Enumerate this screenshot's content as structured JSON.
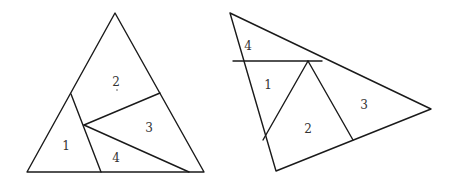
{
  "figures": [
    {
      "name": "left-triangle",
      "outline": [
        [
          115,
          13
        ],
        [
          27,
          172
        ],
        [
          204,
          172
        ]
      ],
      "cuts": [
        [
          [
            71,
            94
          ],
          [
            101,
            172
          ]
        ],
        [
          [
            84,
            125
          ],
          [
            160,
            93
          ]
        ],
        [
          [
            84,
            125
          ],
          [
            189,
            172
          ]
        ]
      ],
      "pieces": [
        {
          "label": "1",
          "x": 66,
          "y": 150
        },
        {
          "label": "2",
          "x": 116,
          "y": 86
        },
        {
          "label": "3",
          "x": 149,
          "y": 132
        },
        {
          "label": "4",
          "x": 116,
          "y": 162
        }
      ],
      "marks": [
        {
          "x": 117,
          "y": 90
        }
      ]
    },
    {
      "name": "right-triangle",
      "outline": [
        [
          230,
          13
        ],
        [
          431,
          109
        ],
        [
          276,
          171
        ]
      ],
      "cuts": [
        [
          [
            233,
            61
          ],
          [
            322,
            61
          ]
        ],
        [
          [
            308,
            61
          ],
          [
            263,
            140
          ]
        ],
        [
          [
            308,
            61
          ],
          [
            353,
            140
          ]
        ]
      ],
      "pieces": [
        {
          "label": "4",
          "x": 248,
          "y": 50
        },
        {
          "label": "1",
          "x": 268,
          "y": 89
        },
        {
          "label": "2",
          "x": 308,
          "y": 133
        },
        {
          "label": "3",
          "x": 364,
          "y": 109
        }
      ],
      "marks": []
    }
  ],
  "colors": {
    "stroke": "#1a1a1a",
    "label": "#333333",
    "background": "#ffffff"
  }
}
